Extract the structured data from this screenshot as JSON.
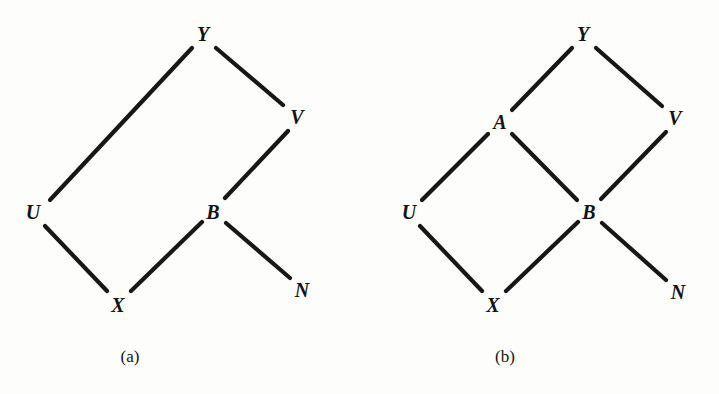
{
  "figure": {
    "background_color": "#fdfdfb",
    "ink_color": "#171717",
    "panels": [
      {
        "id": "a",
        "caption": "(a)",
        "caption_pos": {
          "x": 130,
          "y": 357
        },
        "nodes": [
          {
            "id": "Y",
            "label": "Y",
            "x": 203,
            "y": 34
          },
          {
            "id": "V",
            "label": "V",
            "x": 297,
            "y": 117
          },
          {
            "id": "U",
            "label": "U",
            "x": 33,
            "y": 212
          },
          {
            "id": "B",
            "label": "B",
            "x": 213,
            "y": 212
          },
          {
            "id": "X",
            "label": "X",
            "x": 118,
            "y": 305
          },
          {
            "id": "N",
            "label": "N",
            "x": 302,
            "y": 290
          }
        ],
        "edges": [
          {
            "from": "U",
            "to": "Y",
            "x1": 50,
            "y1": 200,
            "x2": 192,
            "y2": 48
          },
          {
            "from": "Y",
            "to": "V",
            "x1": 216,
            "y1": 48,
            "x2": 283,
            "y2": 105
          },
          {
            "from": "V",
            "to": "B",
            "x1": 288,
            "y1": 131,
            "x2": 225,
            "y2": 198
          },
          {
            "from": "U",
            "to": "X",
            "x1": 45,
            "y1": 226,
            "x2": 107,
            "y2": 291
          },
          {
            "from": "X",
            "to": "B",
            "x1": 131,
            "y1": 291,
            "x2": 202,
            "y2": 222
          },
          {
            "from": "B",
            "to": "N",
            "x1": 226,
            "y1": 223,
            "x2": 290,
            "y2": 278
          }
        ]
      },
      {
        "id": "b",
        "caption": "(b)",
        "caption_pos": {
          "x": 505,
          "y": 357
        },
        "nodes": [
          {
            "id": "Y",
            "label": "Y",
            "x": 583,
            "y": 34
          },
          {
            "id": "A",
            "label": "A",
            "x": 500,
            "y": 122
          },
          {
            "id": "V",
            "label": "V",
            "x": 675,
            "y": 118
          },
          {
            "id": "U",
            "label": "U",
            "x": 409,
            "y": 212
          },
          {
            "id": "B",
            "label": "B",
            "x": 589,
            "y": 212
          },
          {
            "id": "X",
            "label": "X",
            "x": 493,
            "y": 305
          },
          {
            "id": "N",
            "label": "N",
            "x": 678,
            "y": 292
          }
        ],
        "edges": [
          {
            "from": "A",
            "to": "Y",
            "x1": 512,
            "y1": 110,
            "x2": 572,
            "y2": 48
          },
          {
            "from": "Y",
            "to": "V",
            "x1": 596,
            "y1": 48,
            "x2": 662,
            "y2": 106
          },
          {
            "from": "U",
            "to": "A",
            "x1": 422,
            "y1": 200,
            "x2": 488,
            "y2": 134
          },
          {
            "from": "A",
            "to": "B",
            "x1": 512,
            "y1": 134,
            "x2": 577,
            "y2": 200
          },
          {
            "from": "V",
            "to": "B",
            "x1": 666,
            "y1": 132,
            "x2": 601,
            "y2": 199
          },
          {
            "from": "U",
            "to": "X",
            "x1": 420,
            "y1": 226,
            "x2": 482,
            "y2": 291
          },
          {
            "from": "X",
            "to": "B",
            "x1": 506,
            "y1": 291,
            "x2": 578,
            "y2": 222
          },
          {
            "from": "B",
            "to": "N",
            "x1": 602,
            "y1": 223,
            "x2": 666,
            "y2": 280
          }
        ]
      }
    ]
  }
}
